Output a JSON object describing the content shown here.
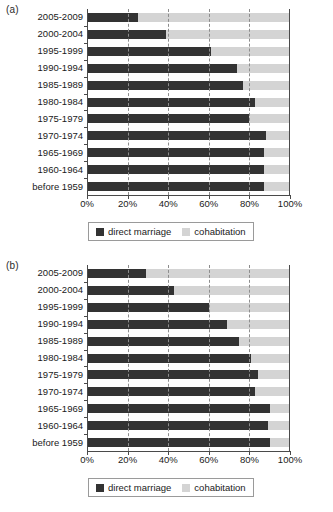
{
  "figure": {
    "panels": [
      {
        "label": "(a)",
        "chart_key": 0
      },
      {
        "label": "(b)",
        "chart_key": 1
      }
    ]
  },
  "legend": {
    "items": [
      {
        "label": "direct marriage",
        "color": "#333333",
        "swatch": "dark"
      },
      {
        "label": "cohabitation",
        "color": "#d4d4d4",
        "swatch": "light"
      }
    ]
  },
  "axis": {
    "xticks": [
      "0%",
      "20%",
      "40%",
      "60%",
      "80%",
      "100%"
    ],
    "xtick_values": [
      0,
      20,
      40,
      60,
      80,
      100
    ]
  },
  "chart_data": [
    {
      "type": "bar",
      "orientation": "horizontal",
      "stacked": true,
      "normalized": true,
      "panel": "(a)",
      "title": "",
      "xlabel": "",
      "ylabel": "",
      "xlim": [
        0,
        100
      ],
      "grid": "vertical-dashed",
      "legend_position": "below",
      "categories": [
        "2005-2009",
        "2000-2004",
        "1995-1999",
        "1990-1994",
        "1985-1989",
        "1980-1984",
        "1975-1979",
        "1970-1974",
        "1965-1969",
        "1960-1964",
        "before 1959"
      ],
      "series": [
        {
          "name": "direct marriage",
          "color": "#333333",
          "values": [
            25,
            39,
            61,
            74,
            77,
            83,
            80,
            88,
            87,
            87,
            87
          ]
        },
        {
          "name": "cohabitation",
          "color": "#d4d4d4",
          "values": [
            75,
            61,
            39,
            26,
            23,
            17,
            20,
            12,
            13,
            13,
            13
          ]
        }
      ]
    },
    {
      "type": "bar",
      "orientation": "horizontal",
      "stacked": true,
      "normalized": true,
      "panel": "(b)",
      "title": "",
      "xlabel": "",
      "ylabel": "",
      "xlim": [
        0,
        100
      ],
      "grid": "vertical-dashed",
      "legend_position": "below",
      "categories": [
        "2005-2009",
        "2000-2004",
        "1995-1999",
        "1990-1994",
        "1985-1989",
        "1980-1984",
        "1975-1979",
        "1970-1974",
        "1965-1969",
        "1960-1964",
        "before 1959"
      ],
      "series": [
        {
          "name": "direct marriage",
          "color": "#333333",
          "values": [
            29,
            43,
            60,
            69,
            75,
            81,
            84,
            83,
            90,
            89,
            90
          ]
        },
        {
          "name": "cohabitation",
          "color": "#d4d4d4",
          "values": [
            71,
            57,
            40,
            31,
            25,
            19,
            16,
            17,
            10,
            11,
            10
          ]
        }
      ]
    }
  ]
}
